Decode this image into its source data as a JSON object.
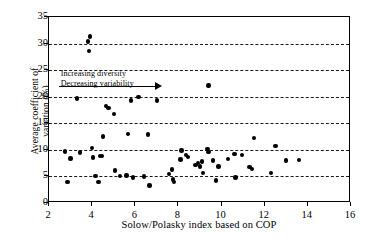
{
  "chart_data": {
    "type": "scatter",
    "title": "",
    "xlabel": "Solow/Polasky index based on COP",
    "ylabel": "Average coefficient of variation (%)",
    "ylabel_lines": [
      "Average coefficient of",
      "variation (%)"
    ],
    "xlim": [
      2,
      16
    ],
    "ylim": [
      0,
      35
    ],
    "xticks": [
      2,
      4,
      6,
      8,
      10,
      12,
      14,
      16
    ],
    "yticks": [
      0,
      5,
      10,
      15,
      20,
      25,
      30,
      35
    ],
    "gridlines": [
      5,
      10,
      15,
      20,
      25,
      30
    ],
    "grid": "horizontal-dashed",
    "legend": "none",
    "marker_color": "#000000",
    "annotations": [
      {
        "line1": "Increasing diversity",
        "line2": "Decreasing variability",
        "arrow": "right"
      }
    ],
    "points": [
      {
        "x": 2.75,
        "y": 9.7
      },
      {
        "x": 2.85,
        "y": 3.9
      },
      {
        "x": 3.0,
        "y": 8.4
      },
      {
        "x": 3.3,
        "y": 19.7
      },
      {
        "x": 3.45,
        "y": 9.5
      },
      {
        "x": 3.8,
        "y": 30.4
      },
      {
        "x": 3.9,
        "y": 31.3
      },
      {
        "x": 3.85,
        "y": 28.6
      },
      {
        "x": 4.0,
        "y": 10.4
      },
      {
        "x": 4.05,
        "y": 8.6
      },
      {
        "x": 4.15,
        "y": 5.1
      },
      {
        "x": 4.3,
        "y": 3.9
      },
      {
        "x": 4.35,
        "y": 8.8
      },
      {
        "x": 4.45,
        "y": 8.9
      },
      {
        "x": 4.5,
        "y": 12.5
      },
      {
        "x": 4.65,
        "y": 18.2
      },
      {
        "x": 4.75,
        "y": 17.9
      },
      {
        "x": 5.0,
        "y": 16.8
      },
      {
        "x": 5.05,
        "y": 6.1
      },
      {
        "x": 5.3,
        "y": 5.05
      },
      {
        "x": 5.65,
        "y": 13.0
      },
      {
        "x": 5.6,
        "y": 5.15
      },
      {
        "x": 5.8,
        "y": 19.3
      },
      {
        "x": 5.9,
        "y": 4.8
      },
      {
        "x": 6.15,
        "y": 19.9
      },
      {
        "x": 6.4,
        "y": 5.0
      },
      {
        "x": 6.6,
        "y": 12.9
      },
      {
        "x": 6.65,
        "y": 3.3
      },
      {
        "x": 7.0,
        "y": 19.3
      },
      {
        "x": 7.55,
        "y": 5.5
      },
      {
        "x": 7.7,
        "y": 6.3
      },
      {
        "x": 7.75,
        "y": 4.4
      },
      {
        "x": 7.8,
        "y": 3.9
      },
      {
        "x": 8.1,
        "y": 8.2
      },
      {
        "x": 8.15,
        "y": 9.9
      },
      {
        "x": 8.35,
        "y": 9.0
      },
      {
        "x": 8.45,
        "y": 8.7
      },
      {
        "x": 8.8,
        "y": 7.2
      },
      {
        "x": 8.9,
        "y": 7.5
      },
      {
        "x": 9.0,
        "y": 6.9
      },
      {
        "x": 9.1,
        "y": 7.8
      },
      {
        "x": 9.15,
        "y": 5.6
      },
      {
        "x": 9.4,
        "y": 22.1
      },
      {
        "x": 9.35,
        "y": 10.2
      },
      {
        "x": 9.4,
        "y": 9.6
      },
      {
        "x": 9.6,
        "y": 8.0
      },
      {
        "x": 9.75,
        "y": 4.2
      },
      {
        "x": 9.85,
        "y": 6.9
      },
      {
        "x": 10.3,
        "y": 8.3
      },
      {
        "x": 10.6,
        "y": 9.2
      },
      {
        "x": 10.65,
        "y": 4.8
      },
      {
        "x": 10.95,
        "y": 9.0
      },
      {
        "x": 11.3,
        "y": 6.8
      },
      {
        "x": 11.4,
        "y": 6.4
      },
      {
        "x": 11.5,
        "y": 12.2
      },
      {
        "x": 12.3,
        "y": 5.7
      },
      {
        "x": 12.5,
        "y": 10.7
      },
      {
        "x": 13.0,
        "y": 8.0
      },
      {
        "x": 13.6,
        "y": 8.1
      }
    ]
  }
}
